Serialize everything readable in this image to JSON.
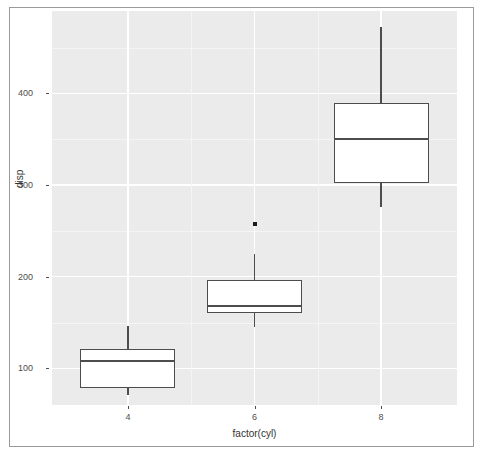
{
  "figure": {
    "panel_background": "#ebebeb",
    "grid_color": "#ffffff",
    "line_color": "#4d4d4d",
    "border_color": "#9a9a9a"
  },
  "axes": {
    "y_title": "disp",
    "x_title": "factor(cyl)",
    "y_ticks": [
      "100",
      "200",
      "300",
      "400"
    ],
    "x_ticks": [
      "4",
      "6",
      "8"
    ]
  },
  "chart_data": {
    "type": "box",
    "title": "",
    "xlabel": "factor(cyl)",
    "ylabel": "disp",
    "categories": [
      "4",
      "6",
      "8"
    ],
    "ylim": [
      60,
      490
    ],
    "xlim": [
      0.4,
      3.6
    ],
    "y_ticks": [
      100,
      200,
      300,
      400
    ],
    "y_tick_labels": [
      "100",
      "200",
      "300",
      "400"
    ],
    "x_tick_labels": [
      "4",
      "6",
      "8"
    ],
    "grid": true,
    "legend": "none",
    "boxes": [
      {
        "category": "4",
        "lower_whisker": 71.1,
        "q1": 78.85,
        "median": 108.0,
        "q3": 120.65,
        "upper_whisker": 146.7,
        "outliers": []
      },
      {
        "category": "6",
        "lower_whisker": 145.0,
        "q1": 160.0,
        "median": 167.6,
        "q3": 196.3,
        "upper_whisker": 225.0,
        "outliers": [
          258.0
        ]
      },
      {
        "category": "8",
        "lower_whisker": 275.8,
        "q1": 301.75,
        "median": 350.5,
        "q3": 390.0,
        "upper_whisker": 472.0,
        "outliers": []
      }
    ]
  }
}
